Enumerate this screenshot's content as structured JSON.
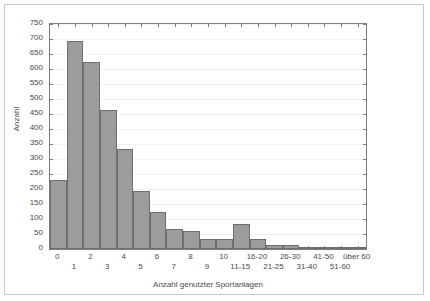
{
  "chart_data": {
    "type": "bar",
    "title": "",
    "xlabel": "Anzahl genutzter Sportanlagen",
    "ylabel": "Anzahl",
    "categories": [
      "0",
      "1",
      "2",
      "3",
      "4",
      "5",
      "6",
      "7",
      "8",
      "9",
      "10",
      "11-15",
      "16-20",
      "21-25",
      "26-30",
      "31-40",
      "41-50",
      "51-60",
      "über 60"
    ],
    "values": [
      230,
      693,
      622,
      463,
      332,
      192,
      125,
      68,
      60,
      34,
      32,
      85,
      32,
      12,
      12,
      4,
      5,
      2,
      2
    ],
    "ylim": [
      0,
      750
    ],
    "ytick_step": 50,
    "yticks": [
      "750",
      "700",
      "650",
      "600",
      "550",
      "500",
      "450",
      "400",
      "350",
      "300",
      "250",
      "200",
      "150",
      "100",
      "50",
      "0"
    ],
    "grid": true,
    "legend": false,
    "bar_fill": "#9c9c9c",
    "bar_edge": "#6e6e6e",
    "axis_color": "#7d7d7d",
    "grid_color": "#f0f0f0",
    "border_color": "#c9c9c9"
  }
}
